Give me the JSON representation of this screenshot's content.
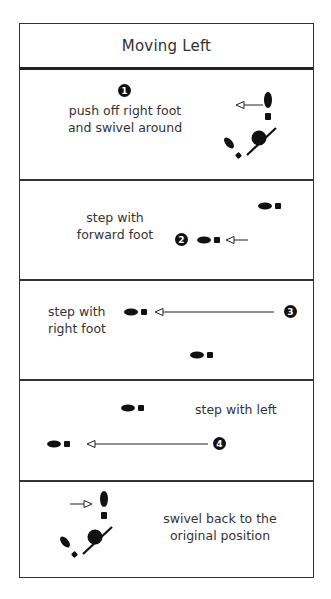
{
  "title": "Moving Left",
  "steps": [
    {
      "number": "1",
      "text_line1": "push off right foot",
      "text_line2": "and swivel around"
    },
    {
      "number": "2",
      "text_line1": "step with",
      "text_line2": "forward foot"
    },
    {
      "number": "3",
      "text_line1": "step with",
      "text_line2": "right foot"
    },
    {
      "number": "4",
      "text_line1": "step with left"
    },
    {
      "number": "",
      "text_line1": "swivel back to the",
      "text_line2": "original position"
    }
  ],
  "icons": {
    "footprint": "footprint-icon",
    "arrow_left": "arrow-left-icon",
    "arrow_right": "arrow-right-icon",
    "pivot": "pivot-ball-icon"
  },
  "colors": {
    "ink": "#111111",
    "border": "#333333",
    "background": "#ffffff"
  }
}
